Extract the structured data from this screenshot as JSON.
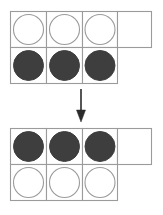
{
  "figure": {
    "type": "counter-grid-transformation",
    "background_color": "#ffffff",
    "stroke_color": "#9b9b9b",
    "filled_color": "#3e3e3e",
    "arrow_color": "#2b2b2b",
    "grid_geometry": {
      "left": 10,
      "right": 152,
      "column_edges": [
        10,
        46,
        82,
        117,
        152
      ],
      "cell_width": 36,
      "row_height": 36,
      "circle_radius": 15,
      "extra_cell_column_index": 3,
      "extra_cell_rows": [
        "top"
      ]
    },
    "grids": [
      {
        "name": "top-grid",
        "label": "before",
        "origin_y": 11,
        "rows": [
          {
            "name": "top-row",
            "cells": [
              {
                "counter": "empty"
              },
              {
                "counter": "empty"
              },
              {
                "counter": "empty"
              },
              {
                "counter": "none"
              }
            ]
          },
          {
            "name": "bottom-row",
            "cells": [
              {
                "counter": "filled"
              },
              {
                "counter": "filled"
              },
              {
                "counter": "filled"
              }
            ]
          }
        ]
      },
      {
        "name": "bottom-grid",
        "label": "after",
        "origin_y": 128,
        "rows": [
          {
            "name": "top-row",
            "cells": [
              {
                "counter": "filled"
              },
              {
                "counter": "filled"
              },
              {
                "counter": "filled"
              },
              {
                "counter": "none"
              }
            ]
          },
          {
            "name": "bottom-row",
            "cells": [
              {
                "counter": "empty"
              },
              {
                "counter": "empty"
              },
              {
                "counter": "empty"
              }
            ]
          }
        ]
      }
    ],
    "arrow": {
      "name": "transformation-arrow",
      "direction": "down",
      "x": 81,
      "y_start": 89,
      "y_end": 122,
      "shaft_end": 112,
      "head_half_width": 4.5
    }
  }
}
